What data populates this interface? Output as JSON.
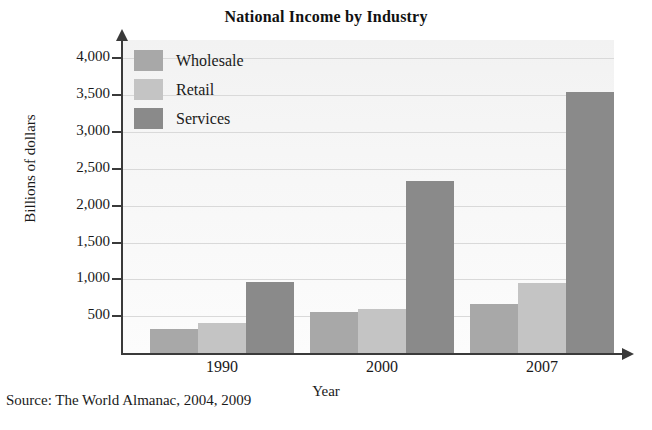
{
  "chart_data": {
    "type": "bar",
    "title": "National Income by Industry",
    "xlabel": "Year",
    "ylabel": "Billions of dollars",
    "categories": [
      "1990",
      "2000",
      "2007"
    ],
    "series": [
      {
        "name": "Wholesale",
        "color": "#a8a8a8",
        "values": [
          330,
          560,
          660
        ]
      },
      {
        "name": "Retail",
        "color": "#c4c4c4",
        "values": [
          410,
          600,
          950
        ]
      },
      {
        "name": "Services",
        "color": "#8a8a8a",
        "values": [
          960,
          2330,
          3550
        ]
      }
    ],
    "ylim": [
      0,
      4250
    ],
    "yticks": [
      500,
      1000,
      1500,
      2000,
      2500,
      3000,
      3500,
      4000
    ],
    "ytick_labels": [
      "500",
      "1,000",
      "1,500",
      "2,000",
      "2,500",
      "3,000",
      "3,500",
      "4,000"
    ],
    "grid": true,
    "legend_position": "top-left-inside",
    "source": "Source: The World Almanac, 2004, 2009",
    "plot_background": "#f5f5f5",
    "axis_color": "#3a3a3a"
  }
}
